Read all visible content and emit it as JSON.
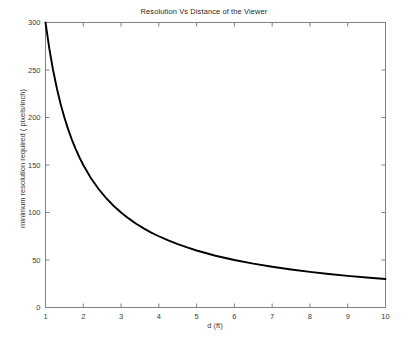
{
  "chart_data": {
    "type": "line",
    "title": "Resolution Vs Distance of the Viewer",
    "xlabel": "d (ft)",
    "ylabel": "minimum resolution required ( pixels/inch)",
    "xlim": [
      1,
      10
    ],
    "ylim": [
      0,
      300
    ],
    "xticks": [
      1,
      2,
      3,
      4,
      5,
      6,
      7,
      8,
      9,
      10
    ],
    "xtick_labels": [
      "1",
      "2",
      "3",
      "4",
      "5",
      "6",
      "7",
      "8",
      "9",
      "10"
    ],
    "yticks": [
      0,
      50,
      100,
      150,
      200,
      250,
      300
    ],
    "ytick_labels": [
      "0",
      "50",
      "100",
      "150",
      "200",
      "250",
      "300"
    ],
    "grid": false,
    "legend": null,
    "legend_position": "none",
    "line_color": "#000000",
    "axis_color": "#808080",
    "background_color": "#ffffff",
    "series": [
      {
        "name": "minimum resolution required",
        "x": [
          1.0,
          1.1,
          1.2,
          1.3,
          1.4,
          1.5,
          1.6,
          1.7,
          1.8,
          1.9,
          2.0,
          2.2,
          2.4,
          2.6,
          2.8,
          3.0,
          3.2,
          3.4,
          3.6,
          3.8,
          4.0,
          4.25,
          4.5,
          4.75,
          5.0,
          5.5,
          6.0,
          6.5,
          7.0,
          7.5,
          8.0,
          8.5,
          9.0,
          9.5,
          10.0
        ],
        "values": [
          300.0,
          272.7,
          250.0,
          230.8,
          214.3,
          200.0,
          187.5,
          176.5,
          166.7,
          157.9,
          150.0,
          136.4,
          125.0,
          115.4,
          107.1,
          100.0,
          93.8,
          88.2,
          83.3,
          78.9,
          75.0,
          70.6,
          66.7,
          63.2,
          60.0,
          54.5,
          50.0,
          46.2,
          42.9,
          40.0,
          37.5,
          35.3,
          33.3,
          31.6,
          30.0
        ]
      }
    ]
  }
}
